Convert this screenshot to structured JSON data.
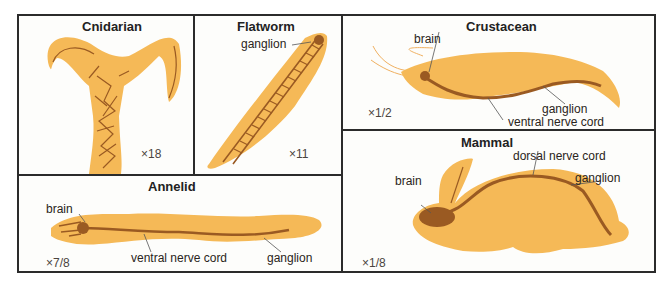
{
  "colors": {
    "body": "#f5b957",
    "nerve": "#9a5a22",
    "border": "#2b2b2b",
    "text": "#2a2420"
  },
  "panels": {
    "cnidarian": {
      "title": "Cnidarian",
      "scale": "×18",
      "labels": []
    },
    "flatworm": {
      "title": "Flatworm",
      "scale": "×11",
      "labels": [
        "ganglion"
      ]
    },
    "crustacean": {
      "title": "Crustacean",
      "scale": "×1/2",
      "labels": [
        "brain",
        "ganglion",
        "ventral nerve cord"
      ]
    },
    "annelid": {
      "title": "Annelid",
      "scale": "×7/8",
      "labels": [
        "brain",
        "ventral nerve cord",
        "ganglion"
      ]
    },
    "mammal": {
      "title": "Mammal",
      "scale": "×1/8",
      "labels": [
        "dorsal nerve cord",
        "brain",
        "ganglion"
      ]
    }
  }
}
